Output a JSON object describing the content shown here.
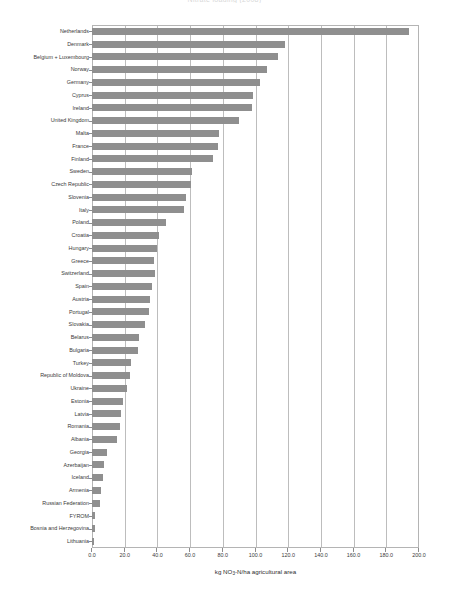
{
  "chart_data": {
    "type": "bar",
    "orientation": "horizontal",
    "title": "Nitrate loading (2008)",
    "xlabel_parts": {
      "pre": "kg NO",
      "sub": "3",
      "post": "-N/ha agricultural area"
    },
    "xlabel": "kg NO3-N/ha agricultural area",
    "ylabel": "",
    "xlim": [
      0.0,
      200.0
    ],
    "xticks": [
      0.0,
      20.0,
      40.0,
      60.0,
      80.0,
      100.0,
      120.0,
      140.0,
      160.0,
      180.0,
      200.0
    ],
    "xtick_labels": [
      "0.0",
      "20.0",
      "40.0",
      "60.0",
      "80.0",
      "100.0",
      "120.0",
      "140.0",
      "160.0",
      "180.0",
      "200.0"
    ],
    "grid": "vertical",
    "legend": "none",
    "bar_color": "#8f8f8f",
    "categories": [
      "Netherlands",
      "Denmark",
      "Belgium + Luxembourg",
      "Norway",
      "Germany",
      "Cyprus",
      "Ireland",
      "United Kingdom",
      "Malta",
      "France",
      "Finland",
      "Sweden",
      "Czech Republic",
      "Slovenia",
      "Italy",
      "Poland",
      "Croatia",
      "Hungary",
      "Greece",
      "Switzerland",
      "Spain",
      "Austria",
      "Portugal",
      "Slovakia",
      "Belarus",
      "Bulgaria",
      "Turkey",
      "Republic of Moldova",
      "Ukraine",
      "Estonia",
      "Latvia",
      "Romania",
      "Albania",
      "Georgia",
      "Azerbaijan",
      "Iceland",
      "Armenia",
      "Russian Federation",
      "FYROM",
      "Bosnia and Herzegovina",
      "Lithuania"
    ],
    "values": [
      194.0,
      118.0,
      114.0,
      107.0,
      103.0,
      98.5,
      98.0,
      90.0,
      77.5,
      77.0,
      74.0,
      61.0,
      60.5,
      57.5,
      56.0,
      45.0,
      41.0,
      40.0,
      38.0,
      38.5,
      37.0,
      35.5,
      35.0,
      32.5,
      28.5,
      28.0,
      24.0,
      23.0,
      21.5,
      19.0,
      17.5,
      17.0,
      15.0,
      9.0,
      7.5,
      6.5,
      5.5,
      5.0,
      2.0,
      1.8,
      1.2
    ]
  }
}
